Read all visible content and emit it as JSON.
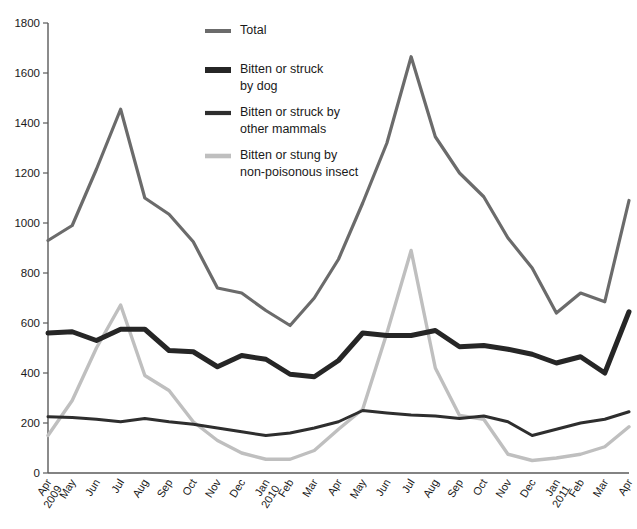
{
  "chart_data": {
    "type": "line",
    "title": "",
    "xlabel": "",
    "ylabel": "",
    "ylim": [
      0,
      1800
    ],
    "ytick_step": 200,
    "yticks": [
      0,
      200,
      400,
      600,
      800,
      1000,
      1200,
      1400,
      1600,
      1800
    ],
    "grid": false,
    "legend_position": "top-center",
    "categories": [
      "Apr 2009",
      "May",
      "Jun",
      "Jul",
      "Aug",
      "Sep",
      "Oct",
      "Nov",
      "Dec",
      "Jan 2010",
      "Feb",
      "Mar",
      "Apr",
      "May",
      "Jun",
      "Jul",
      "Aug",
      "Sep",
      "Oct",
      "Nov",
      "Dec",
      "Jan 2011",
      "Feb",
      "Mar",
      "Apr"
    ],
    "series": [
      {
        "name": "Total",
        "color": "#6b6b6b",
        "width": 3.2,
        "values": [
          930,
          990,
          1215,
          1455,
          1100,
          1035,
          925,
          740,
          720,
          650,
          590,
          700,
          855,
          1080,
          1320,
          1665,
          1345,
          1200,
          1105,
          940,
          820,
          640,
          720,
          685,
          1090
        ]
      },
      {
        "name": "Bitten or struck by dog",
        "color": "#262626",
        "width": 5.0,
        "values": [
          560,
          565,
          530,
          575,
          575,
          490,
          485,
          425,
          470,
          455,
          395,
          385,
          450,
          560,
          550,
          550,
          570,
          505,
          510,
          495,
          475,
          440,
          465,
          400,
          645
        ]
      },
      {
        "name": "Bitten or struck by other mammals",
        "color": "#2e2e2e",
        "width": 3.0,
        "values": [
          225,
          222,
          215,
          205,
          218,
          205,
          195,
          180,
          165,
          150,
          160,
          180,
          205,
          250,
          240,
          232,
          228,
          218,
          228,
          205,
          150,
          175,
          200,
          215,
          245
        ]
      },
      {
        "name": "Bitten or stung by non-poisonous insect",
        "color": "#bfbfbf",
        "width": 3.4,
        "values": [
          150,
          290,
          500,
          672,
          390,
          330,
          205,
          130,
          80,
          55,
          55,
          90,
          175,
          255,
          560,
          890,
          420,
          230,
          215,
          75,
          50,
          60,
          75,
          105,
          185
        ]
      }
    ]
  },
  "legend": {
    "items": [
      {
        "label_line1": "Total",
        "label_line2": ""
      },
      {
        "label_line1": "Bitten or struck",
        "label_line2": "by dog"
      },
      {
        "label_line1": "Bitten or struck by",
        "label_line2": "other mammals"
      },
      {
        "label_line1": "Bitten or stung by",
        "label_line2": "non-poisonous insect"
      }
    ]
  }
}
